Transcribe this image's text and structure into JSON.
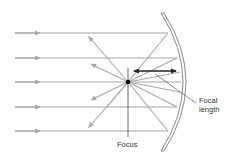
{
  "diagram": {
    "labels": {
      "focus": "Focus",
      "focal_length_line1": "Focal",
      "focal_length_line2": "length"
    },
    "colors": {
      "ray": "#a8a8a8",
      "mirror": "#888888",
      "focus_dot": "#000000",
      "dimension_arrow": "#222222",
      "leader_line": "#555555",
      "text": "#333333"
    },
    "incident_rays_y": [
      33,
      58,
      82,
      107,
      131
    ],
    "focus_point": {
      "x": 128,
      "y": 82
    },
    "mirror": {
      "top": {
        "x": 163,
        "y": 13
      },
      "bottom": {
        "x": 163,
        "y": 151
      },
      "apex_x": 183
    }
  }
}
